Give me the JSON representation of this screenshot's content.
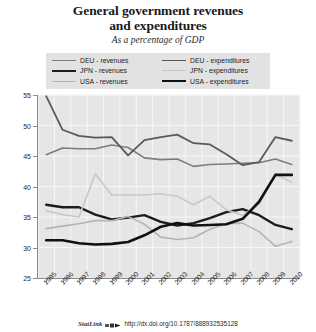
{
  "title_line1": "General government revenues",
  "title_line2": "and expenditures",
  "subtitle": "As a percentage of GDP",
  "legend": {
    "left": [
      {
        "label": "DEU - revenues",
        "color": "#7d7d7d",
        "width": 1.6
      },
      {
        "label": "JPN - revenues",
        "color": "#1c1c1c",
        "width": 2.4
      },
      {
        "label": "USA - revenues",
        "color": "#b4b4b4",
        "width": 1.6
      }
    ],
    "right": [
      {
        "label": "DEU - expenditures",
        "color": "#5a5a5a",
        "width": 1.8
      },
      {
        "label": "JPN - expenditures",
        "color": "#c8c8c8",
        "width": 1.6
      },
      {
        "label": "USA - expenditures",
        "color": "#111111",
        "width": 2.6
      }
    ]
  },
  "source": {
    "statlink": "StatLink",
    "icon": "statlink-icon",
    "url": "http://dx.doi.org/10.1787/888932535128"
  },
  "chart_data": {
    "type": "line",
    "title": "General government revenues and expenditures",
    "subtitle": "As a percentage of GDP",
    "xlabel": "",
    "ylabel": "",
    "ylim": [
      25,
      55
    ],
    "yticks": [
      25,
      30,
      35,
      40,
      45,
      50,
      55
    ],
    "grid": true,
    "legend_position": "top",
    "categories": [
      "1995",
      "1996",
      "1997",
      "1998",
      "1999",
      "2000",
      "2001",
      "2002",
      "2003",
      "2004",
      "2005",
      "2006",
      "2007",
      "2008",
      "2009",
      "2010"
    ],
    "series": [
      {
        "name": "DEU - revenues",
        "color": "#7d7d7d",
        "width": 1.6,
        "values": [
          45.2,
          46.3,
          46.2,
          46.2,
          46.8,
          46.4,
          44.7,
          44.4,
          44.5,
          43.3,
          43.6,
          43.7,
          43.8,
          43.9,
          44.5,
          43.6
        ]
      },
      {
        "name": "JPN - revenues",
        "color": "#1c1c1c",
        "width": 2.4,
        "values": [
          37.0,
          36.6,
          36.6,
          35.4,
          34.6,
          34.9,
          35.3,
          34.2,
          33.6,
          34.0,
          34.8,
          35.8,
          36.3,
          35.3,
          33.7,
          33.0
        ]
      },
      {
        "name": "USA - revenues",
        "color": "#b4b4b4",
        "width": 1.6,
        "values": [
          33.1,
          33.5,
          33.9,
          34.4,
          34.4,
          35.1,
          33.8,
          31.7,
          31.3,
          31.6,
          33.0,
          33.9,
          34.0,
          32.6,
          30.2,
          31.0
        ]
      },
      {
        "name": "DEU - expenditures",
        "color": "#5a5a5a",
        "width": 1.8,
        "values": [
          54.8,
          49.3,
          48.3,
          48.0,
          48.1,
          45.1,
          47.6,
          48.1,
          48.5,
          47.1,
          46.9,
          45.3,
          43.5,
          44.0,
          48.1,
          47.5
        ]
      },
      {
        "name": "JPN - expenditures",
        "color": "#c8c8c8",
        "width": 1.6,
        "values": [
          36.0,
          35.4,
          35.0,
          42.1,
          38.6,
          38.6,
          38.6,
          38.8,
          38.4,
          37.0,
          38.4,
          36.2,
          35.3,
          37.1,
          42.0,
          40.7
        ]
      },
      {
        "name": "USA - expenditures",
        "color": "#111111",
        "width": 2.6,
        "values": [
          31.2,
          31.2,
          30.7,
          30.5,
          30.6,
          30.9,
          32.0,
          33.4,
          34.0,
          33.6,
          33.7,
          33.8,
          34.7,
          37.5,
          41.9,
          41.9
        ]
      }
    ]
  }
}
